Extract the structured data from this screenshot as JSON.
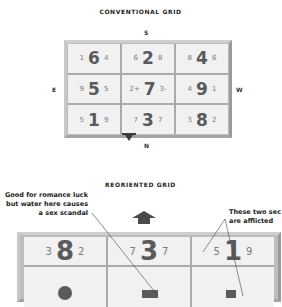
{
  "conventional": {
    "title": "CONVENTIONAL GRID",
    "directions": {
      "top": "S",
      "bottom": "N",
      "left": "E",
      "right": "W"
    },
    "rows": [
      [
        {
          "left": "1",
          "center": "6",
          "right": "4"
        },
        {
          "left": "6",
          "center": "2",
          "right": "8"
        },
        {
          "left": "8",
          "center": "4",
          "right": "6"
        }
      ],
      [
        {
          "left": "9",
          "center": "5",
          "right": "5"
        },
        {
          "left": "2+",
          "center": "7",
          "right": "3-"
        },
        {
          "left": "4",
          "center": "9",
          "right": "1"
        }
      ],
      [
        {
          "left": "5",
          "center": "1",
          "right": "9"
        },
        {
          "left": "7",
          "center": "3",
          "right": "7"
        },
        {
          "left": "3",
          "center": "8",
          "right": "2"
        }
      ]
    ],
    "marker_icon": "triangle-down-icon"
  },
  "reoriented": {
    "title": "REORIENTED GRID",
    "arrow_icon": "arrow-up-icon",
    "rows": [
      [
        {
          "left": "3",
          "center": "8",
          "right": "2"
        },
        {
          "left": "7",
          "center": "3",
          "right": "7"
        },
        {
          "left": "5",
          "center": "1",
          "right": "9"
        }
      ]
    ],
    "annotations": {
      "left": [
        "Good for romance luck",
        "but water here causes",
        "a sex scandal"
      ],
      "right": [
        "These two sec",
        "are afflicted"
      ]
    }
  },
  "colors": {
    "frame": "#bdbdbd",
    "cell": "#f1f1f1",
    "digits": "#5a5a5a",
    "arrow": "#4a4a4a"
  }
}
